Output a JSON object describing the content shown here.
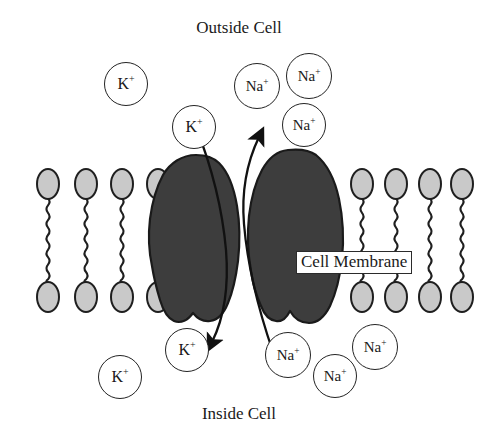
{
  "diagram": {
    "title_top": "Outside Cell",
    "title_bottom": "Inside Cell",
    "membrane_label": "Cell Membrane",
    "colors": {
      "background": "#ffffff",
      "protein_fill": "#3d3d3d",
      "protein_stroke": "#1a1a1a",
      "lipid_head_fill": "#c9c9c9",
      "lipid_stroke": "#1f1f1f",
      "ion_stroke": "#232323",
      "text": "#1a1a1a"
    }
  },
  "ions": [
    {
      "id": "k-out-1",
      "species": "K",
      "charge": "+",
      "region": "outside",
      "x": 104,
      "y": 62,
      "d": 42
    },
    {
      "id": "k-out-2",
      "species": "K",
      "charge": "+",
      "region": "outside",
      "x": 172,
      "y": 105,
      "d": 42
    },
    {
      "id": "na-out-1",
      "species": "Na",
      "charge": "+",
      "region": "outside",
      "x": 234,
      "y": 63,
      "d": 44
    },
    {
      "id": "na-out-2",
      "species": "Na",
      "charge": "+",
      "region": "outside",
      "x": 286,
      "y": 53,
      "d": 44
    },
    {
      "id": "na-out-3",
      "species": "Na",
      "charge": "+",
      "region": "outside",
      "x": 282,
      "y": 103,
      "d": 42
    },
    {
      "id": "k-in-1",
      "species": "K",
      "charge": "+",
      "region": "inside",
      "x": 98,
      "y": 355,
      "d": 42
    },
    {
      "id": "k-in-2",
      "species": "K",
      "charge": "+",
      "region": "inside",
      "x": 165,
      "y": 328,
      "d": 42
    },
    {
      "id": "na-in-1",
      "species": "Na",
      "charge": "+",
      "region": "inside",
      "x": 265,
      "y": 332,
      "d": 44
    },
    {
      "id": "na-in-2",
      "species": "Na",
      "charge": "+",
      "region": "inside",
      "x": 313,
      "y": 354,
      "d": 42
    },
    {
      "id": "na-in-3",
      "species": "Na",
      "charge": "+",
      "region": "inside",
      "x": 352,
      "y": 324,
      "d": 44
    }
  ],
  "lipids": {
    "left_x": [
      48,
      86,
      122,
      158
    ],
    "right_x": [
      362,
      396,
      430,
      462
    ],
    "top_head_cy": 184,
    "bottom_head_cy": 297,
    "head_rx": 11,
    "head_ry": 15
  },
  "proteins": [
    {
      "id": "protein-left",
      "name": "pump-protein-left"
    },
    {
      "id": "protein-right",
      "name": "pump-protein-right"
    }
  ],
  "arrows": [
    {
      "id": "na-efflux-arrow",
      "name": "sodium-out-arrow",
      "ion": "Na",
      "direction": "outward",
      "description": "Na+ moves from inside cell to outside cell through the pump"
    },
    {
      "id": "k-influx-arrow",
      "name": "potassium-in-arrow",
      "ion": "K",
      "direction": "inward",
      "description": "K+ moves from outside cell to inside cell through the pump"
    }
  ]
}
